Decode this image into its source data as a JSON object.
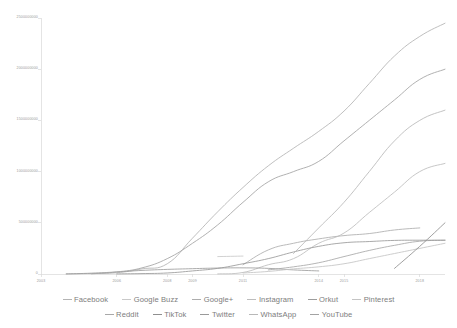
{
  "chart_data": {
    "type": "line",
    "title": "",
    "subtitle": "",
    "xlabel": "",
    "ylabel": "",
    "grid": false,
    "legend_position": "bottom",
    "x": [
      2003,
      2004,
      2005,
      2006,
      2007,
      2008,
      2009,
      2010,
      2011,
      2012,
      2013,
      2014,
      2015,
      2016,
      2017,
      2018,
      2019
    ],
    "xlim": [
      2003,
      2019
    ],
    "ylim": [
      0,
      2500000000
    ],
    "x_ticks": [
      2003,
      2006,
      2008,
      2009,
      2011,
      2014,
      2015,
      2018
    ],
    "x_tick_labels": [
      "2003",
      "2006",
      "2008",
      "2009",
      "2011",
      "2014",
      "2015",
      "2018"
    ],
    "y_ticks": [
      0,
      500000000,
      1000000000,
      1500000000,
      2000000000,
      2500000000
    ],
    "y_tick_labels": [
      "0",
      "500000000",
      "1000000000",
      "1500000000",
      "2000000000",
      "2500000000"
    ],
    "series": [
      {
        "name": "Facebook",
        "color": "#b4b4b4",
        "x": [
          2004,
          2005,
          2006,
          2007,
          2008,
          2009,
          2010,
          2011,
          2012,
          2013,
          2014,
          2015,
          2016,
          2017,
          2018,
          2019
        ],
        "values": [
          1000000,
          5500000,
          12000000,
          50000000,
          100000000,
          350000000,
          608000000,
          845000000,
          1056000000,
          1228000000,
          1393000000,
          1591000000,
          1860000000,
          2129000000,
          2320000000,
          2449000000
        ]
      },
      {
        "name": "Google Buzz",
        "color": "#c9c9c9",
        "x": [
          2010,
          2011
        ],
        "values": [
          170000000,
          175000000
        ]
      },
      {
        "name": "Google+",
        "color": "#adadad",
        "x": [
          2011,
          2012,
          2013,
          2014,
          2015,
          2016,
          2017,
          2018
        ],
        "values": [
          90000000,
          235000000,
          300000000,
          343000000,
          375000000,
          395000000,
          430000000,
          450000000
        ]
      },
      {
        "name": "Instagram",
        "color": "#bdbdbd",
        "x": [
          2010,
          2011,
          2012,
          2013,
          2014,
          2015,
          2016,
          2017,
          2018,
          2019
        ],
        "values": [
          1000000,
          15000000,
          90000000,
          150000000,
          300000000,
          400000000,
          600000000,
          800000000,
          1000000000,
          1080000000
        ]
      },
      {
        "name": "Orkut",
        "color": "#9d9d9d",
        "x": [
          2004,
          2005,
          2006,
          2007,
          2008,
          2009,
          2010,
          2011,
          2012,
          2013,
          2014
        ],
        "values": [
          1000000,
          8000000,
          20000000,
          35000000,
          45000000,
          52000000,
          58000000,
          60000000,
          55000000,
          40000000,
          30000000
        ]
      },
      {
        "name": "Pinterest",
        "color": "#c4c4c4",
        "x": [
          2011,
          2012,
          2013,
          2014,
          2015,
          2016,
          2017,
          2018,
          2019
        ],
        "values": [
          10000000,
          25000000,
          50000000,
          70000000,
          100000000,
          150000000,
          200000000,
          250000000,
          300000000
        ]
      },
      {
        "name": "Reddit",
        "color": "#a8a8a8",
        "x": [
          2012,
          2013,
          2014,
          2015,
          2016,
          2017,
          2018,
          2019
        ],
        "values": [
          40000000,
          70000000,
          110000000,
          170000000,
          230000000,
          280000000,
          320000000,
          330000000
        ]
      },
      {
        "name": "TikTok",
        "color": "#8f8f8f",
        "x": [
          2017,
          2018,
          2019
        ],
        "values": [
          55000000,
          270000000,
          500000000
        ]
      },
      {
        "name": "Twitter",
        "color": "#9a9a9a",
        "x": [
          2006,
          2007,
          2008,
          2009,
          2010,
          2011,
          2012,
          2013,
          2014,
          2015,
          2016,
          2017,
          2018,
          2019
        ],
        "values": [
          1000000,
          4000000,
          10000000,
          30000000,
          55000000,
          100000000,
          150000000,
          215000000,
          270000000,
          305000000,
          317000000,
          328000000,
          330000000,
          330000000
        ]
      },
      {
        "name": "WhatsApp",
        "color": "#b8b8b8",
        "x": [
          2013,
          2014,
          2015,
          2016,
          2017,
          2018,
          2019
        ],
        "values": [
          200000000,
          450000000,
          700000000,
          1000000000,
          1300000000,
          1500000000,
          1600000000
        ]
      },
      {
        "name": "YouTube",
        "color": "#a3a3a3",
        "x": [
          2005,
          2006,
          2007,
          2008,
          2009,
          2010,
          2011,
          2012,
          2013,
          2014,
          2015,
          2016,
          2017,
          2018,
          2019
        ],
        "values": [
          2000000,
          20000000,
          60000000,
          150000000,
          300000000,
          480000000,
          700000000,
          900000000,
          1000000000,
          1100000000,
          1300000000,
          1500000000,
          1700000000,
          1900000000,
          2000000000
        ]
      }
    ]
  },
  "legend": {
    "row1": [
      {
        "label": "Facebook",
        "color": "#b4b4b4"
      },
      {
        "label": "Google Buzz",
        "color": "#c9c9c9"
      },
      {
        "label": "Google+",
        "color": "#adadad"
      },
      {
        "label": "Instagram",
        "color": "#bdbdbd"
      },
      {
        "label": "Orkut",
        "color": "#9d9d9d"
      },
      {
        "label": "Pinterest",
        "color": "#c4c4c4"
      }
    ],
    "row2": [
      {
        "label": "Reddit",
        "color": "#a8a8a8"
      },
      {
        "label": "TikTok",
        "color": "#8f8f8f"
      },
      {
        "label": "Twitter",
        "color": "#9a9a9a"
      },
      {
        "label": "WhatsApp",
        "color": "#b8b8b8"
      },
      {
        "label": "YouTube",
        "color": "#a3a3a3"
      }
    ]
  },
  "axis": {
    "line_color": "#d8d8d8",
    "label_color": "#9a9a9a"
  }
}
